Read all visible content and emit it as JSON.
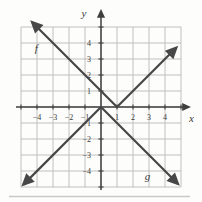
{
  "figure": {
    "background": "#fdfdfc"
  },
  "chart_data": {
    "type": "line",
    "title": "",
    "grid": true,
    "axes": {
      "x": {
        "label": "x",
        "range": [
          -5,
          5
        ],
        "ticks": [
          {
            "v": -4,
            "label": "−4"
          },
          {
            "v": -3,
            "label": "−3"
          },
          {
            "v": -2,
            "label": "−2"
          },
          {
            "v": -1,
            "label": "−1"
          },
          {
            "v": 1,
            "label": "1"
          },
          {
            "v": 2,
            "label": "2"
          },
          {
            "v": 3,
            "label": "3"
          },
          {
            "v": 4,
            "label": "4"
          }
        ]
      },
      "y": {
        "label": "y",
        "range": [
          -5,
          5
        ],
        "ticks": [
          {
            "v": 4,
            "label": "4"
          },
          {
            "v": 3,
            "label": "3"
          },
          {
            "v": 2,
            "label": "2"
          },
          {
            "v": 1,
            "label": "1"
          },
          {
            "v": -1,
            "label": "−1"
          },
          {
            "v": -2,
            "label": "−2"
          },
          {
            "v": -3,
            "label": "−3"
          },
          {
            "v": -4,
            "label": "−4"
          }
        ]
      }
    },
    "series": [
      {
        "name": "f",
        "shape": "absolute-value V opening upward",
        "vertex": [
          1,
          0
        ],
        "y_intercept": 1,
        "points": [
          [
            -4.3,
            5.3
          ],
          [
            1,
            0
          ],
          [
            4.7,
            3.7
          ]
        ],
        "arrows": "both",
        "label_pos": [
          -4.05,
          3.65
        ]
      },
      {
        "name": "g",
        "shape": "absolute-value V opening downward",
        "vertex": [
          0,
          0
        ],
        "y_intercept": 0,
        "points": [
          [
            -4.85,
            -4.85
          ],
          [
            0,
            0
          ],
          [
            4.8,
            -4.8
          ]
        ],
        "arrows": "both",
        "label_pos": [
          2.9,
          -4.35
        ]
      }
    ],
    "colors": {
      "grid": "#b9b9b9",
      "axis": "#3f3f3f",
      "line": "#474747",
      "text": "#3a3a3a",
      "page_edge": "#c9c9c7"
    }
  }
}
